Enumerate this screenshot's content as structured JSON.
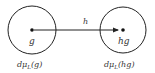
{
  "diagram": {
    "left_node": {
      "point_label": "g",
      "measure_label": "dμ",
      "measure_sub": "L",
      "measure_arg": "(g)"
    },
    "right_node": {
      "point_label": "hg",
      "measure_label": "dμ",
      "measure_sub": "L",
      "measure_arg": "(hg)"
    },
    "arrow": {
      "label": "h"
    },
    "colors": {
      "stroke": "#222222",
      "text": "#333333",
      "background": "#ffffff"
    }
  }
}
